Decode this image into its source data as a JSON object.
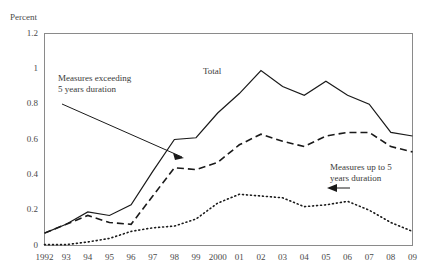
{
  "chart_data": {
    "type": "line",
    "title": "",
    "xlabel": "",
    "ylabel": "Percent",
    "ylim": [
      0,
      1.2
    ],
    "yticks": [
      "0",
      "0.2",
      "0.4",
      "0.6",
      "0.8",
      "1",
      "1.2"
    ],
    "ytick_values": [
      0,
      0.2,
      0.4,
      0.6,
      0.8,
      1,
      1.2
    ],
    "grid": false,
    "legend_position": "inline-annotations",
    "categories": [
      "1992",
      "93",
      "94",
      "95",
      "96",
      "97",
      "98",
      "99",
      "2000",
      "01",
      "02",
      "03",
      "04",
      "05",
      "06",
      "07",
      "08",
      "09"
    ],
    "series": [
      {
        "name": "Total",
        "style": "solid",
        "values": [
          0.07,
          0.12,
          0.19,
          0.17,
          0.23,
          0.42,
          0.6,
          0.61,
          0.75,
          0.86,
          0.99,
          0.9,
          0.85,
          0.93,
          0.85,
          0.8,
          0.64,
          0.62
        ]
      },
      {
        "name": "Measures exceeding 5 years duration",
        "style": "dashed",
        "values": [
          0.07,
          0.12,
          0.17,
          0.13,
          0.12,
          0.28,
          0.44,
          0.43,
          0.47,
          0.57,
          0.63,
          0.59,
          0.56,
          0.62,
          0.64,
          0.64,
          0.56,
          0.53
        ]
      },
      {
        "name": "Measures up to 5 years duration",
        "style": "dotted",
        "values": [
          0.005,
          0.005,
          0.02,
          0.04,
          0.08,
          0.1,
          0.11,
          0.15,
          0.24,
          0.29,
          0.28,
          0.27,
          0.22,
          0.23,
          0.25,
          0.2,
          0.13,
          0.08
        ]
      }
    ],
    "annotations": [
      {
        "id": "exceeding",
        "lines": [
          "Measures exceeding",
          "5 years duration"
        ],
        "arrow": "points-down-right"
      },
      {
        "id": "upto",
        "lines": [
          "Measures up to 5",
          "years duration"
        ],
        "arrow": "points-left"
      },
      {
        "id": "total",
        "lines": [
          "Total"
        ],
        "arrow": "none"
      }
    ]
  },
  "axis": {
    "unit_label": "Percent"
  },
  "colors": {
    "line": "#1a1a1a",
    "axis": "#8a8a8a",
    "text": "#4a4a4a"
  }
}
